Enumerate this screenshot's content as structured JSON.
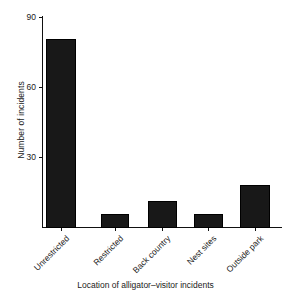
{
  "chart_data": {
    "type": "bar",
    "title": "",
    "xlabel": "Location of alligator–visitor incidents",
    "ylabel": "Number of incidents",
    "categories": [
      "Unrestricted",
      "Restricted",
      "Back country",
      "Nest sites",
      "Outside park"
    ],
    "values": [
      83,
      6,
      12,
      6,
      19
    ],
    "yticks": [
      0,
      30,
      60,
      90
    ],
    "ytick_labels": [
      "",
      "30",
      "60",
      "90"
    ],
    "ylim": [
      0,
      93
    ],
    "grid": false,
    "legend": null,
    "bar_color": "#181818"
  },
  "axis": {
    "y_tick_30": "30",
    "y_tick_60": "60",
    "y_tick_90": "90"
  }
}
